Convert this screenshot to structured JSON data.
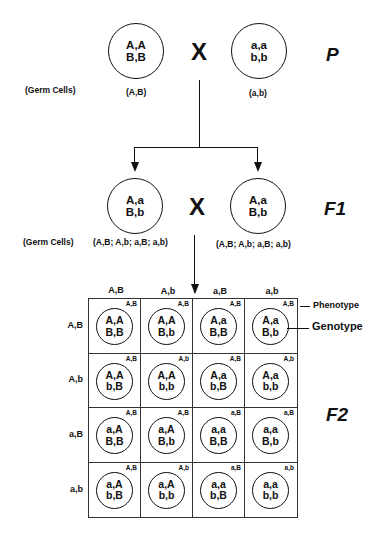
{
  "parental": {
    "label": "P",
    "parent1": {
      "genotype_line1": "A,A",
      "genotype_line2": "B,B",
      "gamete": "(A,B)"
    },
    "cross_symbol": "X",
    "parent2": {
      "genotype_line1": "a,a",
      "genotype_line2": "b,b",
      "gamete": "(a,b)"
    },
    "germ_cells_label": "(Germ Cells)"
  },
  "f1": {
    "label": "F1",
    "parent1": {
      "genotype_line1": "A,a",
      "genotype_line2": "B,b",
      "gamete": "(A,B; A,b; a,B; a,b)"
    },
    "cross_symbol": "X",
    "parent2": {
      "genotype_line1": "A,a",
      "genotype_line2": "B,b",
      "gamete": "(A,B; A,b; a,B; a,b)"
    },
    "germ_cells_label": "(Germ Cells)"
  },
  "f2": {
    "label": "F2",
    "column_headers": [
      "A,B",
      "A,b",
      "a,B",
      "a,b"
    ],
    "row_headers": [
      "A,B",
      "A,b",
      "a,B",
      "a,b"
    ],
    "annotations": {
      "phenotype": "Phenotype",
      "genotype": "Genotype"
    },
    "cells": [
      [
        {
          "phenotype": "A,B",
          "line1": "A,A",
          "line2": "B,B"
        },
        {
          "phenotype": "A,B",
          "line1": "A,A",
          "line2": "B,b"
        },
        {
          "phenotype": "A,B",
          "line1": "A,a",
          "line2": "B,B"
        },
        {
          "phenotype": "A,B",
          "line1": "A,a",
          "line2": "B,b"
        }
      ],
      [
        {
          "phenotype": "A,B",
          "line1": "A,A",
          "line2": "b,B"
        },
        {
          "phenotype": "A,b",
          "line1": "A,A",
          "line2": "b,b"
        },
        {
          "phenotype": "A,B",
          "line1": "A,a",
          "line2": "b,B"
        },
        {
          "phenotype": "A,b",
          "line1": "A,a",
          "line2": "b,b"
        }
      ],
      [
        {
          "phenotype": "A,B",
          "line1": "a,A",
          "line2": "B,B"
        },
        {
          "phenotype": "A,B",
          "line1": "a,A",
          "line2": "B,b"
        },
        {
          "phenotype": "a,B",
          "line1": "a,a",
          "line2": "B,B"
        },
        {
          "phenotype": "a,B",
          "line1": "a,a",
          "line2": "B,b"
        }
      ],
      [
        {
          "phenotype": "A,B",
          "line1": "a,A",
          "line2": "b,B"
        },
        {
          "phenotype": "A,b",
          "line1": "a,A",
          "line2": "b,b"
        },
        {
          "phenotype": "a,B",
          "line1": "a,a",
          "line2": "b,B"
        },
        {
          "phenotype": "a,b",
          "line1": "a,a",
          "line2": "b,b"
        }
      ]
    ]
  }
}
